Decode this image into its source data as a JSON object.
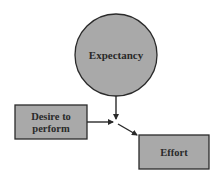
{
  "diagram": {
    "type": "flow",
    "colors": {
      "fill": "#a9a9a9",
      "stroke": "#2a2a2a",
      "text": "#2a2a2a",
      "background": "#ffffff"
    },
    "nodes": [
      {
        "id": "expectancy",
        "shape": "circle",
        "label": "Expectancy"
      },
      {
        "id": "desire",
        "shape": "rect",
        "label_line1": "Desire to",
        "label_line2": "perform"
      },
      {
        "id": "effort",
        "shape": "rect",
        "label": "Effort"
      }
    ],
    "edges": [
      {
        "from": "expectancy",
        "to": "junction"
      },
      {
        "from": "desire",
        "to": "junction"
      },
      {
        "from": "junction",
        "to": "effort"
      }
    ]
  }
}
